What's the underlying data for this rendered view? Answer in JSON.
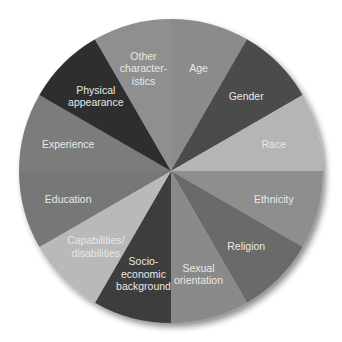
{
  "chart_data": {
    "type": "pie",
    "title": "",
    "center": [
      171,
      171
    ],
    "radius": 152,
    "start_angle_deg": 0,
    "direction": "clockwise",
    "legend": "none",
    "categories": [
      "Age",
      "Gender",
      "Race",
      "Ethnicity",
      "Religion",
      "Sexual orientation",
      "Socio-economic background",
      "Capabilities/disabilities",
      "Education",
      "Experience",
      "Physical appearance",
      "Other characteristics"
    ],
    "values": [
      1,
      1,
      1,
      1,
      1,
      1,
      1,
      1,
      1,
      1,
      1,
      1
    ],
    "slices": [
      {
        "label": "Age",
        "lines": [
          "Age"
        ],
        "value": 1,
        "color": "#8b8b8b"
      },
      {
        "label": "Gender",
        "lines": [
          "Gender"
        ],
        "value": 1,
        "color": "#4b4b4b"
      },
      {
        "label": "Race",
        "lines": [
          "Race"
        ],
        "value": 1,
        "color": "#b5b5b5"
      },
      {
        "label": "Ethnicity",
        "lines": [
          "Ethnicity"
        ],
        "value": 1,
        "color": "#8e8e8e"
      },
      {
        "label": "Religion",
        "lines": [
          "Religion"
        ],
        "value": 1,
        "color": "#6b6b6b"
      },
      {
        "label": "Sexual orientation",
        "lines": [
          "Sexual",
          "orientation"
        ],
        "value": 1,
        "color": "#8a8a8a"
      },
      {
        "label": "Socio-economic background",
        "lines": [
          "Socio-",
          "economic",
          "background"
        ],
        "value": 1,
        "color": "#3c3c3c"
      },
      {
        "label": "Capabilities/disabilities",
        "lines": [
          "Capabilities/",
          "disabilities"
        ],
        "value": 1,
        "color": "#b9b9b9"
      },
      {
        "label": "Education",
        "lines": [
          "Education"
        ],
        "value": 1,
        "color": "#777777"
      },
      {
        "label": "Experience",
        "lines": [
          "Experience"
        ],
        "value": 1,
        "color": "#7b7b7b"
      },
      {
        "label": "Physical appearance",
        "lines": [
          "Physical",
          "appearance"
        ],
        "value": 1,
        "color": "#2f2f2f"
      },
      {
        "label": "Other characteristics",
        "lines": [
          "Other",
          "character-",
          "istics"
        ],
        "value": 1,
        "color": "#8f8f8f"
      }
    ]
  }
}
